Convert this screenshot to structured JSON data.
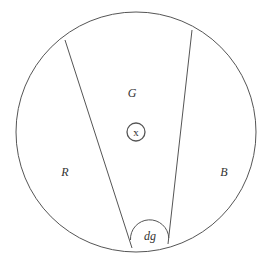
{
  "diagram": {
    "outer_circle": {
      "cx": 136,
      "cy": 132,
      "r": 120
    },
    "dividers": [
      {
        "name": "left-divider",
        "x1": 65,
        "y1": 40,
        "x2": 132,
        "y2": 248
      },
      {
        "name": "right-divider",
        "x1": 192,
        "y1": 30,
        "x2": 168,
        "y2": 244
      }
    ],
    "center_marker": {
      "cx": 136,
      "cy": 132,
      "r": 9,
      "label": "x"
    },
    "dg_arc": {
      "label": "dg"
    },
    "regions": {
      "left": {
        "label": "R"
      },
      "middle": {
        "label": "G"
      },
      "right": {
        "label": "B"
      }
    },
    "stroke_color": "#555555"
  }
}
